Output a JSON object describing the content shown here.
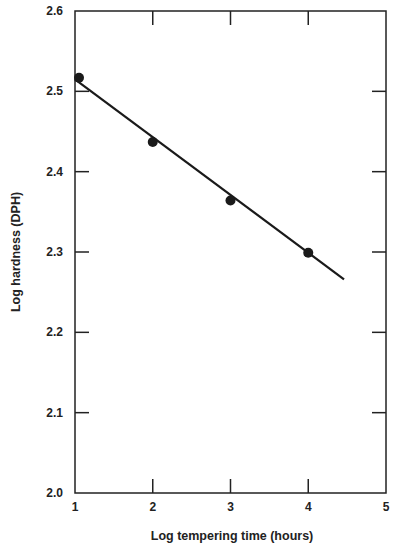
{
  "chart_data": {
    "type": "scatter",
    "title": "",
    "xlabel": "Log tempering time (hours)",
    "ylabel": "Log hardness (DPH)",
    "xlim": [
      1,
      5
    ],
    "ylim": [
      2.0,
      2.6
    ],
    "x_ticks": [
      "1",
      "2",
      "3",
      "4",
      "5"
    ],
    "y_ticks": [
      "2.0",
      "2.1",
      "2.2",
      "2.3",
      "2.4",
      "2.5",
      "2.6"
    ],
    "grid": false,
    "legend": null,
    "series": [
      {
        "name": "Measured",
        "style": "markers",
        "x": [
          1,
          2,
          3,
          4
        ],
        "y": [
          2.517,
          2.437,
          2.364,
          2.299
        ]
      },
      {
        "name": "Linear fit",
        "style": "line",
        "x": [
          1,
          4.46
        ],
        "y": [
          2.515,
          2.266
        ]
      }
    ]
  },
  "colors": {
    "ink": "#222222",
    "background": "#ffffff"
  }
}
